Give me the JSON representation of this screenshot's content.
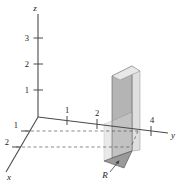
{
  "figure": {
    "background_color": "#ffffff",
    "line_color": "#4a4a4a",
    "text_color": "#1a1a1a"
  },
  "axes": {
    "z": {
      "label": "z",
      "ticks": [
        {
          "label": "1",
          "value": 1
        },
        {
          "label": "2",
          "value": 2
        },
        {
          "label": "3",
          "value": 3
        }
      ]
    },
    "y": {
      "label": "y",
      "ticks": [
        {
          "label": "1",
          "value": 1
        },
        {
          "label": "2",
          "value": 2
        },
        {
          "label": "4",
          "value": 4
        }
      ]
    },
    "x": {
      "label": "x",
      "ticks": [
        {
          "label": "1",
          "value": 1
        },
        {
          "label": "2",
          "value": 2
        }
      ]
    }
  },
  "surfaces": {
    "vertical_panel": {
      "name": "vertical-surface",
      "fill": "#b0b0b0",
      "stroke": "#555555"
    },
    "side_panel": {
      "name": "side-surface",
      "fill": "#d8d8d8",
      "stroke": "#777777"
    },
    "base_region": {
      "name": "base-region",
      "label": "R",
      "fill": "#999999",
      "stroke": "#555555"
    },
    "front_wall": {
      "name": "front-wall",
      "fill": "#c9c9c9",
      "stroke": "#6a6a6a"
    }
  },
  "annotations": {
    "region_label": "R",
    "region_arrow": "arrow pointing from R label to shaded base region"
  }
}
